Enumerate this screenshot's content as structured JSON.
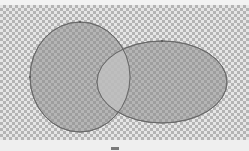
{
  "canvas": {
    "background": "checkerboard",
    "checker_size_px": 3
  },
  "diagram": {
    "type": "venn",
    "shapes": [
      {
        "name": "left-circle",
        "cx": 80,
        "cy": 77,
        "rx": 50,
        "ry": 55,
        "fill": "#8c8c8c",
        "stroke": "#6a6a6a"
      },
      {
        "name": "right-ellipse",
        "cx": 162,
        "cy": 82,
        "rx": 65,
        "ry": 41,
        "fill": "#8c8c8c",
        "stroke": "#6a6a6a"
      }
    ],
    "overlap_fill": "#c9c9c9",
    "control_point_color": "#555555"
  },
  "bottom_bar": {
    "handle_icon": "drag-handle-icon"
  }
}
